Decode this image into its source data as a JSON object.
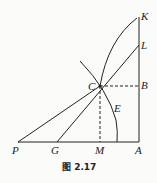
{
  "figure": {
    "caption": "图 2.17",
    "points": {
      "K": "K",
      "L": "L",
      "B": "B",
      "C": "C",
      "E": "E",
      "P": "P",
      "G": "G",
      "M": "M",
      "A": "A"
    }
  }
}
